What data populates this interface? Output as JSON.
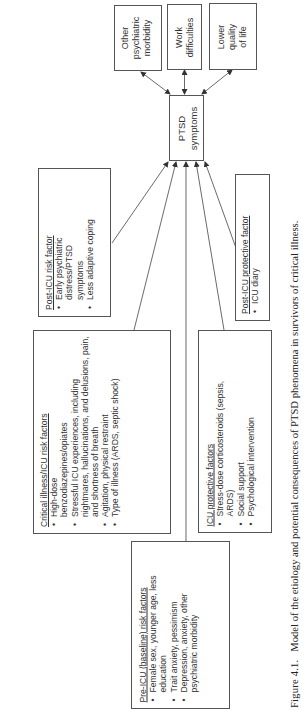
{
  "outcomes": [
    {
      "id": "other",
      "text": "Other psychiatric morbidity",
      "lines": [
        "Other",
        "psychiatric",
        "morbidity"
      ]
    },
    {
      "id": "work",
      "text": "Work difficulties",
      "lines": [
        "Work",
        "difficulties"
      ]
    },
    {
      "id": "qol",
      "text": "Lower quality of life",
      "lines": [
        "Lower",
        "quality",
        "of life"
      ]
    }
  ],
  "center_node": {
    "lines": [
      "PTSD",
      "symptoms"
    ]
  },
  "post_icu_risk": {
    "title": "Post-ICU risk factor",
    "items": [
      "Early psychiatric distress/PTSD symptoms",
      "Less adaptive coping"
    ]
  },
  "post_icu_protective": {
    "title": "Post-ICU protective factor",
    "items": [
      "ICU diary"
    ]
  },
  "critical_illness_risk": {
    "title": "Critical illness/ICU risk factors",
    "items": [
      "High-dose benzodiazepines/opiates",
      "Stressful ICU experiences, including nightmares, hallucinations, and delusions, pain, and shortness of breath",
      "Agitation, physical restraint",
      "Type of illness (ARDS, septic shock)"
    ]
  },
  "icu_protective": {
    "title": "ICU protective factors",
    "items": [
      "Stress-dose corticosteroids (sepsis, ARDS)",
      "Social support",
      "Psychological intervention"
    ]
  },
  "pre_icu_risk": {
    "title": "Pre-ICU (baseline) risk factors",
    "items": [
      "Female sex, younger age, less education",
      "Trait anxiety, pessimism",
      "Depression, anxiety, other psychiatric morbidity"
    ]
  },
  "caption": {
    "label": "Figure 4.1.",
    "text": "Model of the etiology and potential consequences of PTSD phenomena in survivors of critical illness."
  },
  "colors": {
    "line": "#444444",
    "border": "#555555",
    "text": "#333333"
  }
}
